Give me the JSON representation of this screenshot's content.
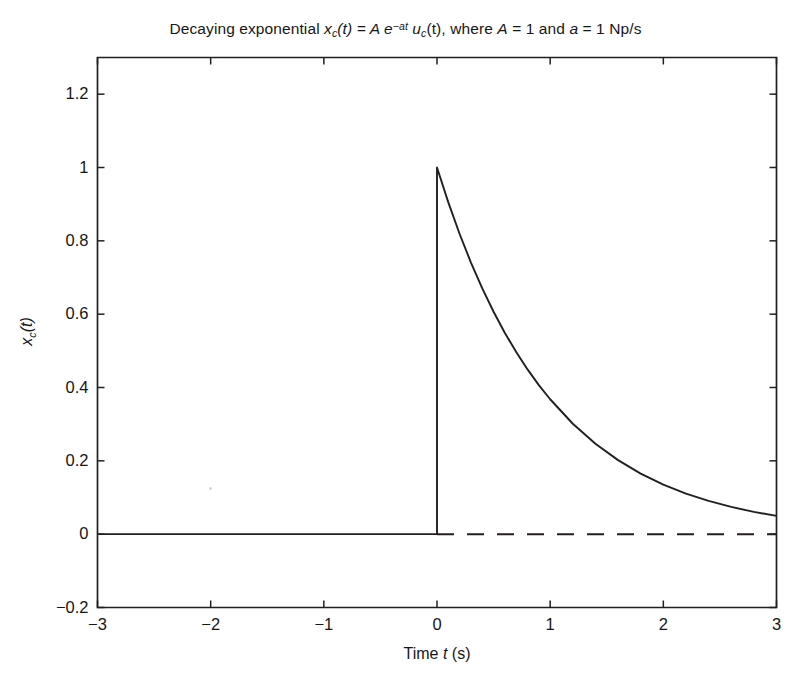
{
  "chart_data": {
    "type": "line",
    "title_parts": {
      "lead": "Decaying exponential ",
      "x_sym": "x",
      "x_sub": "c",
      "x_arg": "(t) = ",
      "amp": "A",
      "e_sym": " e",
      "exponent": "−at",
      "u_sym": " u",
      "u_sub": "c",
      "u_arg": "(t), where ",
      "a_cap": "A",
      "a_cap_val": " = 1 and ",
      "a_low": "a",
      "a_low_val": " = 1 Np/s"
    },
    "xlabel": "Time t (s)",
    "xlabel_parts": {
      "pre": "Time ",
      "sym": "t",
      "post": " (s)"
    },
    "ylabel": "x_c(t)",
    "ylabel_parts": {
      "sym": "x",
      "sub": "c",
      "arg": "(t)"
    },
    "xlim": [
      -3,
      3
    ],
    "ylim": [
      -0.2,
      1.3
    ],
    "xticks": [
      -3,
      -2,
      -1,
      0,
      1,
      2,
      3
    ],
    "xticklabels": [
      "−3",
      "−2",
      "−1",
      "0",
      "1",
      "2",
      "3"
    ],
    "yticks": [
      -0.2,
      0,
      0.2,
      0.4,
      0.6,
      0.8,
      1,
      1.2
    ],
    "yticklabels": [
      "−0.2",
      "0",
      "0.2",
      "0.4",
      "0.6",
      "0.8",
      "1",
      "1.2"
    ],
    "grid": false,
    "legend": null,
    "line_color": "#231f20",
    "series": [
      {
        "name": "x_c(t) = e^{-t} u_c(t)",
        "style": "solid",
        "x": [
          -3.0,
          -2.5,
          -2.0,
          -1.5,
          -1.0,
          -0.5,
          -0.05,
          0.0,
          0.0,
          0.1,
          0.2,
          0.3,
          0.4,
          0.5,
          0.6,
          0.7,
          0.8,
          0.9,
          1.0,
          1.2,
          1.4,
          1.6,
          1.8,
          2.0,
          2.2,
          2.4,
          2.6,
          2.8,
          3.0
        ],
        "y": [
          0.0,
          0.0,
          0.0,
          0.0,
          0.0,
          0.0,
          0.0,
          0.0,
          1.0,
          0.9048,
          0.8187,
          0.7408,
          0.6703,
          0.6065,
          0.5488,
          0.4966,
          0.4493,
          0.4066,
          0.3679,
          0.3012,
          0.2466,
          0.2019,
          0.1653,
          0.1353,
          0.1108,
          0.0907,
          0.0743,
          0.0608,
          0.0498
        ]
      },
      {
        "name": "zero asymptote",
        "style": "dashed",
        "x": [
          0.0,
          3.0
        ],
        "y": [
          0.0,
          0.0
        ]
      }
    ],
    "annotations": [
      {
        "text": "A = 1",
        "meaning": "amplitude"
      },
      {
        "text": "a = 1 Np/s",
        "meaning": "decay rate"
      }
    ]
  }
}
